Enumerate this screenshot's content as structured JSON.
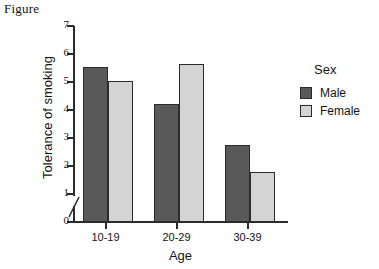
{
  "figure": {
    "caption": "Figure"
  },
  "chart_data": {
    "type": "bar",
    "title": "",
    "xlabel": "Age",
    "ylabel": "Tolerance of smoking",
    "categories": [
      "10-19",
      "20-29",
      "30-39"
    ],
    "series": [
      {
        "name": "Male",
        "color": "#595959",
        "values": [
          5.55,
          4.2,
          2.75
        ]
      },
      {
        "name": "Female",
        "color": "#d4d4d4",
        "values": [
          5.05,
          5.65,
          1.8
        ]
      }
    ],
    "ylim": [
      0,
      7
    ],
    "yticks": [
      0,
      1,
      2,
      3,
      4,
      5,
      6,
      7
    ],
    "ytick_labels": [
      "0",
      "1",
      "2",
      "3",
      "4",
      "5",
      "6",
      "7"
    ],
    "grid": false,
    "axis_break": true,
    "legend": {
      "title": "Sex",
      "position": "right",
      "entries": [
        "Male",
        "Female"
      ]
    }
  },
  "colors": {
    "male": "#595959",
    "female": "#d4d4d4",
    "axis": "#2b2b2b",
    "background": "#ffffff"
  }
}
